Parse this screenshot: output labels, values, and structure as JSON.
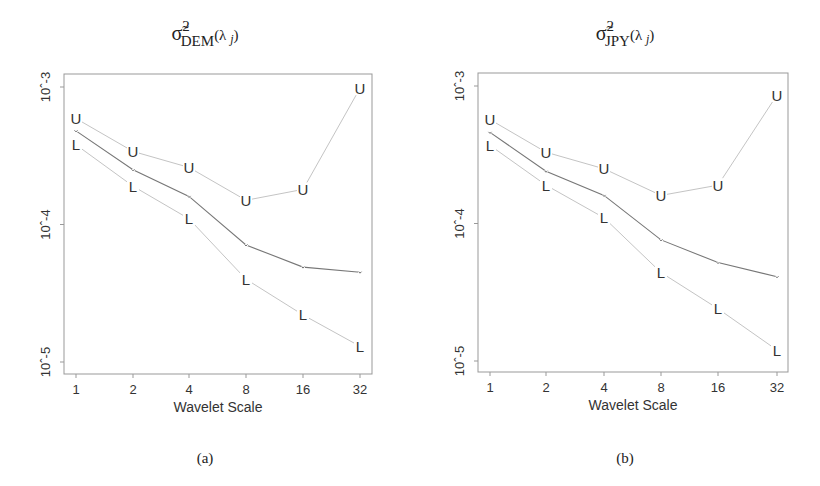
{
  "chart_data": [
    {
      "type": "line",
      "panel": "a",
      "caption": "(a)",
      "title": "σ̃²_DEM(λ_j)",
      "title_parts": {
        "base": "σ̃",
        "sup": "2",
        "sub": "DEM",
        "arg": "(λ j)"
      },
      "xlabel": "Wavelet Scale",
      "ylabel": "",
      "yscale": "log",
      "ylim": [
        7.5e-06,
        0.0013
      ],
      "x": [
        1,
        2,
        4,
        8,
        16,
        32
      ],
      "x_tick_labels": [
        "1",
        "2",
        "4",
        "8",
        "16",
        "32"
      ],
      "y_ticks": [
        0.001,
        0.0001,
        1e-05
      ],
      "y_tick_labels": [
        "10^-3",
        "10^-4",
        "10^-5"
      ],
      "grid": false,
      "legend": null,
      "series": [
        {
          "name": "Estimate",
          "marker": "·",
          "color": "#777777",
          "values": [
            0.00048,
            0.00025,
            0.00016,
            7.1e-05,
            4.9e-05,
            4.5e-05
          ]
        },
        {
          "name": "Upper (U)",
          "marker": "U",
          "color": "#bbbbbb",
          "values": [
            0.00059,
            0.00034,
            0.00026,
            0.00015,
            0.00018,
            0.00098
          ]
        },
        {
          "name": "Lower (L)",
          "marker": "L",
          "color": "#bbbbbb",
          "values": [
            0.00038,
            0.00019,
            0.00011,
            4e-05,
            2.2e-05,
            1.3e-05
          ]
        }
      ]
    },
    {
      "type": "line",
      "panel": "b",
      "caption": "(b)",
      "title": "σ̃²_JPY(λ_j)",
      "title_parts": {
        "base": "σ̃",
        "sup": "2",
        "sub": "JPY",
        "arg": "(λ j)"
      },
      "xlabel": "Wavelet Scale",
      "ylabel": "",
      "yscale": "log",
      "ylim": [
        7.5e-06,
        0.0013
      ],
      "x": [
        1,
        2,
        4,
        8,
        16,
        32
      ],
      "x_tick_labels": [
        "1",
        "2",
        "4",
        "8",
        "16",
        "32"
      ],
      "y_ticks": [
        0.001,
        0.0001,
        1e-05
      ],
      "y_tick_labels": [
        "10^-3",
        "10^-4",
        "10^-5"
      ],
      "grid": false,
      "legend": null,
      "series": [
        {
          "name": "Estimate",
          "marker": "·",
          "color": "#777777",
          "values": [
            0.00046,
            0.00024,
            0.00016,
            7.6e-05,
            5.2e-05,
            4.1e-05
          ]
        },
        {
          "name": "Upper (U)",
          "marker": "U",
          "color": "#bbbbbb",
          "values": [
            0.00057,
            0.00033,
            0.00025,
            0.00016,
            0.00019,
            0.00086
          ]
        },
        {
          "name": "Lower (L)",
          "marker": "L",
          "color": "#bbbbbb",
          "values": [
            0.00037,
            0.00019,
            0.00011,
            4.4e-05,
            2.4e-05,
            1.2e-05
          ]
        }
      ]
    }
  ],
  "panels": [
    {
      "caption": "(a)",
      "title": {
        "base": "σ̃",
        "sup": "2",
        "sub": "DEM",
        "arg": "(λ",
        "arg_j": "j",
        "close": ")"
      },
      "xlabel": "Wavelet Scale",
      "x_tick_labels": [
        "1",
        "2",
        "4",
        "8",
        "16",
        "32"
      ],
      "y_tick_labels": [
        "10^-3",
        "10^-4",
        "10^-5"
      ]
    },
    {
      "caption": "(b)",
      "title": {
        "base": "σ̃",
        "sup": "2",
        "sub": "JPY",
        "arg": "(λ",
        "arg_j": "j",
        "close": ")"
      },
      "xlabel": "Wavelet Scale",
      "x_tick_labels": [
        "1",
        "2",
        "4",
        "8",
        "16",
        "32"
      ],
      "y_tick_labels": [
        "10^-3",
        "10^-4",
        "10^-5"
      ]
    }
  ],
  "markers": {
    "upper": "U",
    "lower": "L",
    "estimate": "-"
  },
  "colors": {
    "estimate_line": "#777777",
    "bound_line": "#c4c4c4",
    "axis": "#999999",
    "text": "#333333"
  }
}
